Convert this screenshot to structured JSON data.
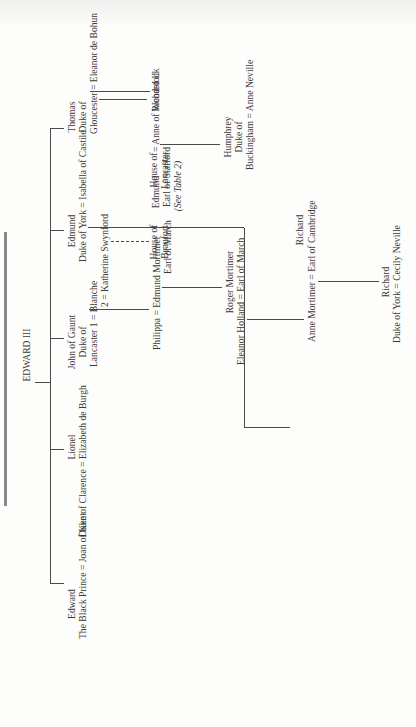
{
  "diagram": {
    "type": "genealogical-tree",
    "orientation": "rotated-90-ccw",
    "root": "EDWARD III",
    "children": {
      "edward": {
        "name": "Edward",
        "title": "The Black Prince",
        "spouse": "Joan of Kent",
        "issue": "Richard II"
      },
      "lionel": {
        "name": "Lionel",
        "title": "Duke of Clarence",
        "spouse": "Elizabeth de Burgh"
      },
      "john": {
        "name": "John of Gaunt",
        "title1": "Duke of",
        "title2": "Lancaster",
        "spouse1": "1 = Blanche",
        "spouse2": "2 = Katherine Swynford"
      },
      "edmund": {
        "name": "Edmund",
        "title": "Duke of York",
        "spouse": "Isabella of Castile"
      },
      "thomas": {
        "name": "Thomas",
        "title1": "Duke of",
        "title2": "Gloucester",
        "spouse": "Eleanor de Bohun"
      }
    },
    "houses": {
      "beaufort": {
        "line1": "House of",
        "line2": "Beaufort"
      },
      "lancaster": {
        "line1": "House of",
        "line2": "Lancaster"
      },
      "note": "(See Table 2)"
    },
    "descendants": {
      "philippa": "Philippa",
      "edmund_mortimer": {
        "name": "Edmund Mortimer",
        "title": "Earl of March"
      },
      "roger_mortimer": {
        "name": "Roger Mortimer",
        "title": "Earl of March"
      },
      "eleanor_holland": "Eleanor Holland",
      "anne_mortimer": "Anne Mortimer",
      "richard_cambridge": {
        "name": "Richard",
        "title": "Earl of Cambridge"
      },
      "richard_york": {
        "name": "Richard",
        "title": "Duke of York",
        "spouse": "Cecily Neville"
      },
      "edmund_stafford": {
        "name": "Edmund",
        "title": "Earl of Stafford"
      },
      "anne_woodstock": "Anne of Woodstock",
      "humphrey": {
        "name": "Humphrey",
        "title1": "Duke of",
        "title2": "Buckingham",
        "spouse": "Anne Neville"
      }
    },
    "marriage_symbol": "=",
    "colors": {
      "ink": "#3a3a3a",
      "line": "#4a4a4a",
      "paper": "#fdfdfc"
    }
  }
}
